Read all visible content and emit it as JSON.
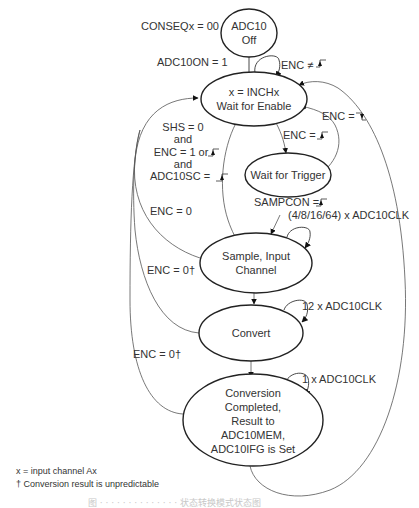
{
  "diagram": {
    "type": "state-machine",
    "states": [
      {
        "id": "off",
        "lines": [
          "ADC10",
          "Off"
        ]
      },
      {
        "id": "wait_enable",
        "lines": [
          "x = INCHx",
          "Wait for Enable"
        ]
      },
      {
        "id": "wait_trigger",
        "lines": [
          "Wait for Trigger"
        ]
      },
      {
        "id": "sample",
        "lines": [
          "Sample, Input",
          "Channel"
        ]
      },
      {
        "id": "convert",
        "lines": [
          "Convert"
        ]
      },
      {
        "id": "completed",
        "lines": [
          "Conversion",
          "Completed,",
          "Result to",
          "ADC10MEM,",
          "ADC10IFG is Set"
        ]
      }
    ],
    "labels": {
      "conseq": "CONSEQx = 00",
      "adc10on": "ADC10ON = 1",
      "enc_not_rise": "ENC ≠",
      "enc_fall": "ENC  =",
      "enc_rise": "ENC  =",
      "shs": [
        "SHS = 0",
        "and",
        "ENC = 1 or",
        "and",
        "ADC10SC ="
      ],
      "sampcon": "SAMPCON =",
      "sample_clk": "(4/8/16/64) x ADC10CLK",
      "enc0_a": "ENC = 0",
      "enc0_b": "ENC = 0†",
      "enc0_c": "ENC = 0†",
      "convert_clk": "12 x ADC10CLK",
      "complete_clk": "1 x ADC10CLK"
    },
    "footnotes": [
      "x = input channel Ax",
      "† Conversion result is unpredictable"
    ],
    "caption": "图 · · · · · · · · · · · · · · 状态转换模式状态图"
  }
}
